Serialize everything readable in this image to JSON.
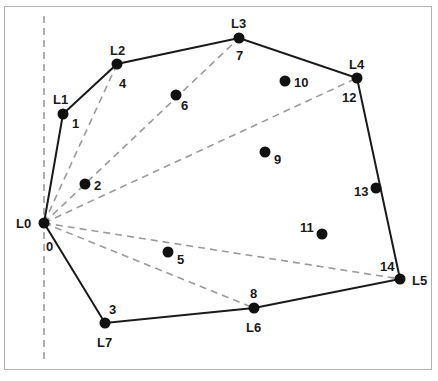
{
  "diagram": {
    "title": "",
    "colors": {
      "hull_edge": "#1a1a1a",
      "fan_edge": "#9a9a9a",
      "axis_line": "#9a9a9a",
      "point": "#111111",
      "frame": "#b4b4b4"
    },
    "axis": {
      "x": 44,
      "y1": 16,
      "y2": 362
    },
    "points": [
      {
        "index": "0",
        "hull_label": "L0",
        "x": 44,
        "y": 223
      },
      {
        "index": "1",
        "hull_label": "L1",
        "x": 63,
        "y": 114
      },
      {
        "index": "2",
        "hull_label": "",
        "x": 85,
        "y": 184
      },
      {
        "index": "3",
        "hull_label": "L7",
        "x": 105,
        "y": 323
      },
      {
        "index": "4",
        "hull_label": "L2",
        "x": 117,
        "y": 64
      },
      {
        "index": "5",
        "hull_label": "",
        "x": 168,
        "y": 252
      },
      {
        "index": "6",
        "hull_label": "",
        "x": 176,
        "y": 95
      },
      {
        "index": "7",
        "hull_label": "L3",
        "x": 239,
        "y": 38
      },
      {
        "index": "8",
        "hull_label": "L6",
        "x": 254,
        "y": 308
      },
      {
        "index": "9",
        "hull_label": "",
        "x": 265,
        "y": 152
      },
      {
        "index": "10",
        "hull_label": "",
        "x": 285,
        "y": 81
      },
      {
        "index": "11",
        "hull_label": "",
        "x": 322,
        "y": 234
      },
      {
        "index": "12",
        "hull_label": "L4",
        "x": 357,
        "y": 78
      },
      {
        "index": "13",
        "hull_label": "",
        "x": 376,
        "y": 188
      },
      {
        "index": "14",
        "hull_label": "L5",
        "x": 400,
        "y": 279
      }
    ],
    "hull_order": [
      "L0",
      "L1",
      "L2",
      "L3",
      "L4",
      "L5",
      "L6",
      "L7"
    ],
    "fan_edges_from_L0": [
      "L2",
      "L3",
      "L4",
      "L5",
      "L6"
    ],
    "labels": {
      "L0": "L0",
      "L1": "L1",
      "L2": "L2",
      "L3": "L3",
      "L4": "L4",
      "L5": "L5",
      "L6": "L6",
      "L7": "L7",
      "n0": "0",
      "n1": "1",
      "n2": "2",
      "n3": "3",
      "n4": "4",
      "n5": "5",
      "n6": "6",
      "n7": "7",
      "n8": "8",
      "n9": "9",
      "n10": "10",
      "n11": "11",
      "n12": "12",
      "n13": "13",
      "n14": "14"
    }
  }
}
